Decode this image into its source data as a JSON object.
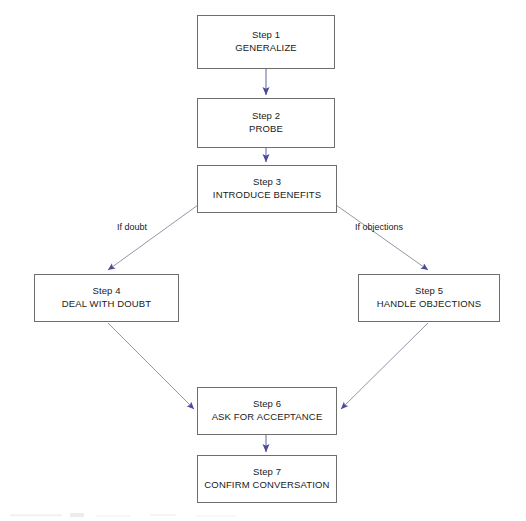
{
  "diagram": {
    "background_color": "#ffffff",
    "box_border_color": "#6e6e6e",
    "arrow_color": "#4a4a9e",
    "line_color": "#8a8a96",
    "text_color": "#1a1a1a",
    "nodes": [
      {
        "id": "step1",
        "step": "Step 1",
        "title": "GENERALIZE",
        "x": 197,
        "y": 15,
        "w": 138,
        "h": 54
      },
      {
        "id": "step2",
        "step": "Step 2",
        "title": "PROBE",
        "x": 197,
        "y": 98,
        "w": 138,
        "h": 50
      },
      {
        "id": "step3",
        "step": "Step 3",
        "title": "INTRODUCE BENEFITS",
        "x": 197,
        "y": 165,
        "w": 140,
        "h": 48
      },
      {
        "id": "step4",
        "step": "Step 4",
        "title": "DEAL WITH DOUBT",
        "x": 34,
        "y": 274,
        "w": 145,
        "h": 48
      },
      {
        "id": "step5",
        "step": "Step 5",
        "title": "HANDLE OBJECTIONS",
        "x": 358,
        "y": 274,
        "w": 142,
        "h": 48
      },
      {
        "id": "step6",
        "step": "Step 6",
        "title": "ASK FOR ACCEPTANCE",
        "x": 197,
        "y": 387,
        "w": 140,
        "h": 48
      },
      {
        "id": "step7",
        "step": "Step 7",
        "title": "CONFIRM CONVERSATION",
        "x": 197,
        "y": 455,
        "w": 140,
        "h": 48
      }
    ],
    "edge_labels": [
      {
        "id": "if-doubt",
        "text": "If doubt",
        "x": 117,
        "y": 222
      },
      {
        "id": "if-objections",
        "text": "If objections",
        "x": 355,
        "y": 222
      }
    ],
    "edges": [
      {
        "id": "step1-to-step2",
        "from": "step1",
        "to": "step2",
        "kind": "vertical"
      },
      {
        "id": "step2-to-step3",
        "from": "step2",
        "to": "step3",
        "kind": "vertical"
      },
      {
        "id": "step3-to-step4",
        "from": "step3",
        "to": "step4",
        "kind": "diagonal",
        "label": "If doubt"
      },
      {
        "id": "step3-to-step5",
        "from": "step3",
        "to": "step5",
        "kind": "diagonal",
        "label": "If objections"
      },
      {
        "id": "step4-to-step6",
        "from": "step4",
        "to": "step6",
        "kind": "diagonal"
      },
      {
        "id": "step5-to-step6",
        "from": "step5",
        "to": "step6",
        "kind": "diagonal"
      },
      {
        "id": "step6-to-step7",
        "from": "step6",
        "to": "step7",
        "kind": "vertical"
      }
    ]
  }
}
